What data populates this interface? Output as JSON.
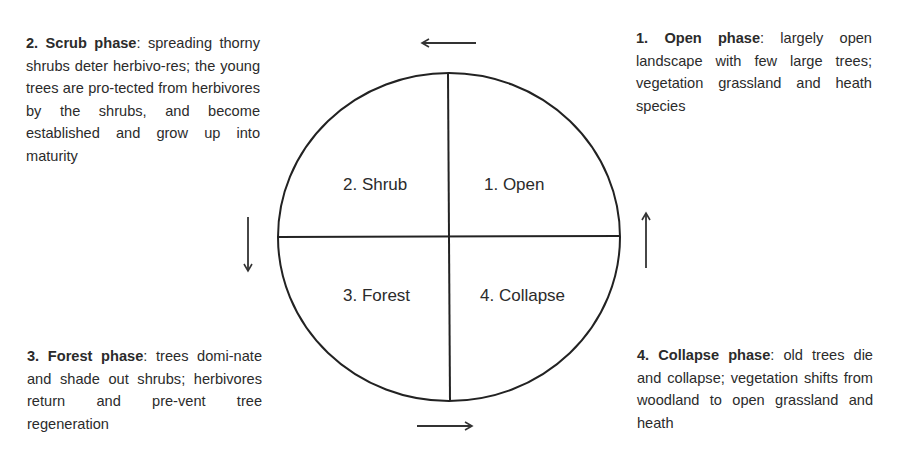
{
  "diagram": {
    "quadrants": [
      {
        "id": "q1",
        "label": "1. Open",
        "position": "top-right"
      },
      {
        "id": "q2",
        "label": "2. Shrub",
        "position": "top-left"
      },
      {
        "id": "q3",
        "label": "3. Forest",
        "position": "bottom-left"
      },
      {
        "id": "q4",
        "label": "4. Collapse",
        "position": "bottom-right"
      }
    ],
    "arrows": [
      {
        "id": "top",
        "direction": "left",
        "from": "1. Open",
        "to": "2. Shrub"
      },
      {
        "id": "left",
        "direction": "down",
        "from": "2. Shrub",
        "to": "3. Forest"
      },
      {
        "id": "bottom",
        "direction": "right",
        "from": "3. Forest",
        "to": "4. Collapse"
      },
      {
        "id": "right",
        "direction": "up",
        "from": "4. Collapse",
        "to": "1. Open"
      }
    ],
    "descriptions": {
      "open": {
        "title": "1. Open phase",
        "text": ": largely open landscape with few large trees; vegetation grassland and heath species"
      },
      "scrub": {
        "title": "2. Scrub phase",
        "text": ": spreading thorny shrubs deter herbivo-res; the young trees are pro-tected from herbivores by the shrubs, and become established and grow up into maturity"
      },
      "forest": {
        "title": "3. Forest phase",
        "text": ": trees domi-nate and shade out shrubs; herbivores return and pre-vent tree regeneration"
      },
      "collapse": {
        "title": "4. Collapse phase",
        "text": ": old trees die and collapse; vegetation shifts from woodland to open grassland and heath"
      }
    },
    "colors": {
      "line": "#222222",
      "text": "#2b2b2b",
      "background": "#ffffff"
    }
  }
}
